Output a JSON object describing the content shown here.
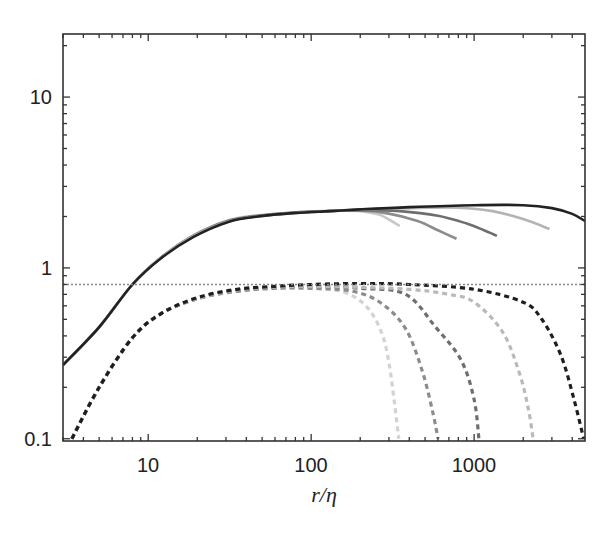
{
  "chart_data": {
    "type": "line",
    "title": "",
    "xlabel": "r/η",
    "ylabel": "",
    "xscale": "log",
    "yscale": "log",
    "xlim": [
      3,
      4790
    ],
    "ylim": [
      0.097,
      23.4
    ],
    "grid": false,
    "legend": null,
    "x_ticks": [
      {
        "value": 10,
        "label": "10"
      },
      {
        "value": 100,
        "label": "100"
      },
      {
        "value": 1000,
        "label": "1000"
      }
    ],
    "y_ticks": [
      {
        "value": 0.1,
        "label": "0.1"
      },
      {
        "value": 1,
        "label": "1"
      },
      {
        "value": 10,
        "label": "10"
      }
    ],
    "reference_line": {
      "y": 0.8,
      "style": "dotted",
      "color": "#888888"
    },
    "series": [
      {
        "name": "solid-1",
        "style": "solid",
        "color": "#c8c8c8",
        "x": [
          3,
          5,
          8,
          12,
          19,
          31,
          47,
          80,
          130,
          200,
          260,
          300,
          350
        ],
        "y": [
          0.27,
          0.45,
          0.8,
          1.15,
          1.55,
          1.9,
          2.03,
          2.12,
          2.16,
          2.15,
          2.05,
          1.92,
          1.76
        ]
      },
      {
        "name": "solid-2",
        "style": "solid",
        "color": "#8c8c8c",
        "x": [
          3,
          5,
          8,
          12,
          19,
          31,
          47,
          80,
          130,
          200,
          300,
          450,
          600,
          780
        ],
        "y": [
          0.27,
          0.45,
          0.8,
          1.15,
          1.55,
          1.89,
          2.02,
          2.11,
          2.15,
          2.17,
          2.08,
          1.88,
          1.66,
          1.48
        ]
      },
      {
        "name": "solid-3",
        "style": "solid",
        "color": "#6e6e6e",
        "x": [
          3,
          5,
          8,
          12,
          19,
          31,
          47,
          80,
          130,
          200,
          350,
          600,
          900,
          1150,
          1380
        ],
        "y": [
          0.27,
          0.45,
          0.8,
          1.15,
          1.54,
          1.88,
          2.01,
          2.1,
          2.15,
          2.18,
          2.15,
          2.02,
          1.82,
          1.66,
          1.54
        ]
      },
      {
        "name": "solid-4",
        "style": "solid",
        "color": "#b4b4b4",
        "x": [
          3,
          5,
          8,
          12,
          19,
          31,
          47,
          80,
          130,
          200,
          400,
          800,
          1300,
          2000,
          2900
        ],
        "y": [
          0.27,
          0.45,
          0.8,
          1.15,
          1.54,
          1.87,
          2.0,
          2.1,
          2.15,
          2.2,
          2.24,
          2.25,
          2.15,
          1.93,
          1.69
        ]
      },
      {
        "name": "solid-5",
        "style": "solid",
        "color": "#222222",
        "x": [
          3,
          5,
          8,
          12,
          19,
          31,
          47,
          80,
          130,
          200,
          400,
          1000,
          2000,
          3000,
          4000,
          4790
        ],
        "y": [
          0.27,
          0.45,
          0.8,
          1.14,
          1.52,
          1.86,
          2.0,
          2.1,
          2.15,
          2.2,
          2.27,
          2.33,
          2.33,
          2.24,
          2.07,
          1.88
        ]
      },
      {
        "name": "dashed-1",
        "style": "dashed",
        "color": "#d2d2d2",
        "x": [
          3.4,
          5,
          8,
          12,
          20,
          35,
          60,
          100,
          160,
          220,
          270,
          300,
          325,
          345
        ],
        "y": [
          0.1,
          0.2,
          0.39,
          0.54,
          0.66,
          0.73,
          0.76,
          0.76,
          0.72,
          0.59,
          0.42,
          0.28,
          0.16,
          0.1
        ]
      },
      {
        "name": "dashed-2",
        "style": "dashed",
        "color": "#8c8c8c",
        "x": [
          3.4,
          5,
          8,
          12,
          20,
          35,
          60,
          100,
          180,
          270,
          380,
          480,
          560,
          600
        ],
        "y": [
          0.1,
          0.2,
          0.39,
          0.54,
          0.66,
          0.73,
          0.76,
          0.76,
          0.73,
          0.62,
          0.44,
          0.25,
          0.14,
          0.1
        ]
      },
      {
        "name": "dashed-3",
        "style": "dashed",
        "color": "#6e6e6e",
        "x": [
          3.4,
          5,
          8,
          12,
          20,
          35,
          60,
          100,
          200,
          380,
          580,
          830,
          1000,
          1070
        ],
        "y": [
          0.1,
          0.2,
          0.39,
          0.54,
          0.66,
          0.74,
          0.77,
          0.78,
          0.76,
          0.7,
          0.45,
          0.29,
          0.17,
          0.1
        ]
      },
      {
        "name": "dashed-4",
        "style": "dashed",
        "color": "#b9b9b9",
        "x": [
          3.4,
          5,
          8,
          12,
          20,
          35,
          60,
          100,
          200,
          400,
          700,
          1000,
          1500,
          1900,
          2150,
          2300
        ],
        "y": [
          0.1,
          0.2,
          0.39,
          0.54,
          0.66,
          0.74,
          0.77,
          0.78,
          0.77,
          0.75,
          0.7,
          0.63,
          0.42,
          0.24,
          0.15,
          0.1
        ]
      },
      {
        "name": "dashed-5",
        "style": "dashed",
        "color": "#1e1e1e",
        "x": [
          3.4,
          5,
          8,
          12,
          20,
          35,
          60,
          100,
          200,
          400,
          1000,
          2000,
          2600,
          3400,
          4100,
          4700
        ],
        "y": [
          0.1,
          0.2,
          0.39,
          0.54,
          0.67,
          0.75,
          0.78,
          0.8,
          0.81,
          0.8,
          0.75,
          0.63,
          0.5,
          0.31,
          0.17,
          0.1
        ]
      }
    ]
  }
}
